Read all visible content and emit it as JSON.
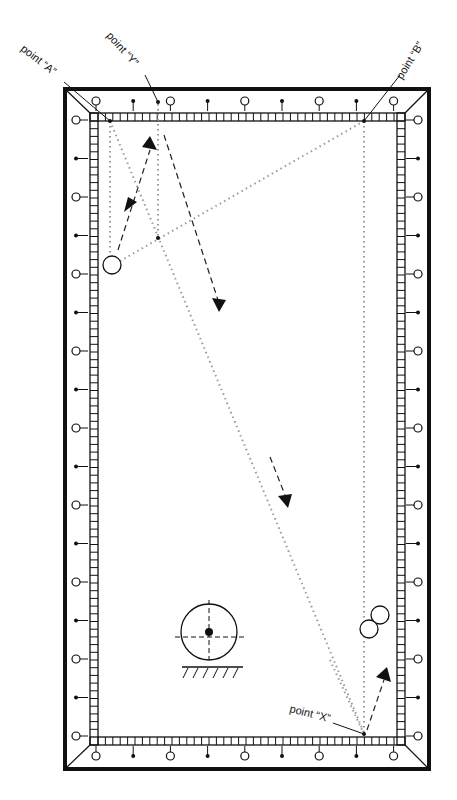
{
  "diagram": {
    "colors": {
      "ink": "#111111",
      "path": "#9a9a9a",
      "background": "#ffffff"
    },
    "labels": {
      "point_a": "point “A”",
      "point_y": "point “Y”",
      "point_b": "point “B”",
      "point_x": "point “X”"
    },
    "points": {
      "A": [
        110,
        121
      ],
      "Y": [
        158,
        102
      ],
      "B": [
        364,
        121
      ],
      "X": [
        364,
        733
      ],
      "intersection": [
        158,
        238
      ]
    },
    "balls": {
      "cue_ball": {
        "cx": 112,
        "cy": 265,
        "r": 9
      },
      "object_ball_1": {
        "cx": 380,
        "cy": 615,
        "r": 9
      },
      "object_ball_2": {
        "cx": 369,
        "cy": 628,
        "r": 9
      }
    },
    "legend_symbol": {
      "name": "ball-rolling-on-surface",
      "cx": 209,
      "cy": 632,
      "r": 28
    }
  }
}
